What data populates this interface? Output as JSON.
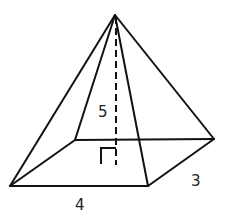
{
  "figure": {
    "type": "rectangular-pyramid",
    "labels": {
      "height": "5",
      "base_length": "4",
      "base_width": "3"
    },
    "colors": {
      "line": "#111111",
      "text": "#222222",
      "background": "#ffffff"
    }
  }
}
